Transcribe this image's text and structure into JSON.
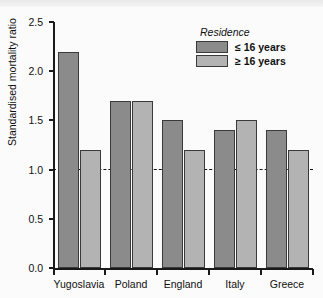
{
  "banner": {
    "ghost_text": ""
  },
  "legend": {
    "title": "Residence",
    "entries": [
      {
        "label": "≤ 16 years",
        "color": "#8b8b8b",
        "key": "le16"
      },
      {
        "label": "≥ 16 years",
        "color": "#b3b3b3",
        "key": "ge16"
      }
    ]
  },
  "axis": {
    "y_title": "Standardised mortality ratio",
    "y_ticks": [
      "0.0",
      "0.5",
      "1.0",
      "1.5",
      "2.0",
      "2.5"
    ]
  },
  "chart_data": {
    "type": "bar",
    "title": "",
    "xlabel": "",
    "ylabel": "Standardised mortality ratio",
    "ylim": [
      0.0,
      2.5
    ],
    "ytick_values": [
      0.0,
      0.5,
      1.0,
      1.5,
      2.0,
      2.5
    ],
    "grid": false,
    "legend_position": "top-right",
    "legend_title": "Residence",
    "reference_line": {
      "value": 1.0,
      "style": "dashed",
      "color": "#111111"
    },
    "categories": [
      "Yugoslavia",
      "Poland",
      "England",
      "Italy",
      "Greece"
    ],
    "series": [
      {
        "name": "≤ 16 years",
        "color": "#8b8b8b",
        "values": [
          2.2,
          1.7,
          1.5,
          1.4,
          1.4
        ]
      },
      {
        "name": "≥ 16 years",
        "color": "#b3b3b3",
        "values": [
          1.2,
          1.7,
          1.2,
          1.5,
          1.2
        ]
      }
    ]
  }
}
